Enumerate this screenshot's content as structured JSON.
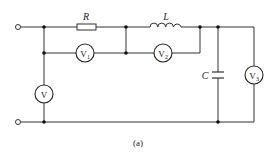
{
  "diagram": {
    "type": "circuit",
    "caption": "(a)",
    "components": {
      "resistor": {
        "label": "R"
      },
      "inductor": {
        "label": "L"
      },
      "capacitor": {
        "label": "C"
      },
      "voltmeter_main": {
        "label": "V",
        "sub": ""
      },
      "voltmeter_1": {
        "label": "V",
        "sub": "1"
      },
      "voltmeter_2": {
        "label": "V",
        "sub": "2"
      },
      "voltmeter_3": {
        "label": "V",
        "sub": "3"
      }
    },
    "colors": {
      "wire": "#333333",
      "background": "#ffffff"
    }
  }
}
